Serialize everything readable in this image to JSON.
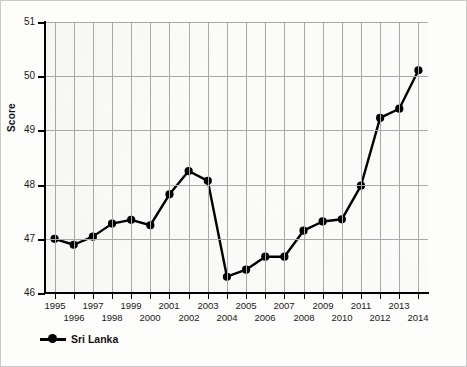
{
  "chart_data": {
    "type": "line",
    "title": "",
    "subtitle": "",
    "xlabel": "",
    "ylabel": "Score",
    "x": [
      1995,
      1996,
      1997,
      1998,
      1999,
      2000,
      2001,
      2002,
      2003,
      2004,
      2005,
      2006,
      2007,
      2008,
      2009,
      2010,
      2011,
      2012,
      2013,
      2014
    ],
    "categories": [
      "1995",
      "1996",
      "1997",
      "1998",
      "1999",
      "2000",
      "2001",
      "2002",
      "2003",
      "2004",
      "2005",
      "2006",
      "2007",
      "2008",
      "2009",
      "2010",
      "2011",
      "2012",
      "2013",
      "2014"
    ],
    "series": [
      {
        "name": "Sri Lanka",
        "color": "#000000",
        "marker": "circle",
        "values": [
          47.0,
          46.89,
          47.04,
          47.28,
          47.35,
          47.25,
          47.82,
          48.25,
          48.07,
          46.3,
          46.43,
          46.67,
          46.67,
          47.15,
          47.32,
          47.36,
          47.98,
          49.23,
          49.4,
          50.11
        ]
      }
    ],
    "xlim": [
      1994.5,
      2014.5
    ],
    "ylim": [
      46,
      51
    ],
    "ytick_values": [
      46,
      47,
      48,
      49,
      50,
      51
    ],
    "ytick_labels": [
      "46",
      "47",
      "48",
      "49",
      "50",
      "51"
    ],
    "xtick_labels": [
      "1995",
      "1996",
      "1997",
      "1998",
      "1999",
      "2000",
      "2001",
      "2002",
      "2003",
      "2004",
      "2005",
      "2006",
      "2007",
      "2008",
      "2009",
      "2010",
      "2011",
      "2012",
      "2013",
      "2014"
    ],
    "xtick_label_stagger": true,
    "grid": true,
    "grid_color": "#a9a9a9",
    "legend_position": "bottom-left",
    "legend_entries": [
      "Sri Lanka"
    ],
    "background_color": "#fbfbfa",
    "frame_color": "#c9c9c9"
  },
  "axis": {
    "y_title": "Score",
    "y_labels": [
      "51",
      "50",
      "49",
      "48",
      "47",
      "46"
    ]
  },
  "legend": {
    "items": [
      {
        "label": "Sri Lanka",
        "color": "#000000"
      }
    ]
  }
}
